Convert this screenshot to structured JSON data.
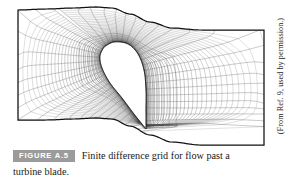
{
  "figure": {
    "badge_label": "FIGURE A.5",
    "caption_line_1": "Finite difference grid for flow past a",
    "caption_line_2": "turbine blade.",
    "credit": "(From Ref. 9, used by permission.)",
    "badge_background": "#9b9b9b",
    "badge_text_color": "#ffffff",
    "line_color": "#3a3a3a",
    "boundary_color": "#111111",
    "background": "#ffffff"
  },
  "chart_data": {
    "type": "line",
    "title": "Finite difference grid for flow past a turbine blade.",
    "xlabel": "",
    "ylabel": "",
    "grid": true,
    "legend": "none",
    "domain": {
      "left_boundary_x": 18,
      "right_boundary_x": 264,
      "top_boundary_left_y": 10,
      "top_boundary_right_y": 30,
      "bottom_boundary_left_y": 120,
      "bottom_boundary_right_y": 145,
      "xlim": [
        18,
        264
      ],
      "ylim": [
        4,
        146
      ]
    },
    "top_boundary": [
      [
        18,
        10
      ],
      [
        46,
        9
      ],
      [
        74,
        8
      ],
      [
        96,
        7
      ],
      [
        112,
        8
      ],
      [
        130,
        14
      ],
      [
        150,
        22
      ],
      [
        172,
        28
      ],
      [
        200,
        30
      ],
      [
        232,
        30
      ],
      [
        264,
        30
      ]
    ],
    "bottom_boundary": [
      [
        18,
        120
      ],
      [
        46,
        120
      ],
      [
        74,
        119
      ],
      [
        96,
        118
      ],
      [
        112,
        119
      ],
      [
        130,
        126
      ],
      [
        150,
        135
      ],
      [
        172,
        142
      ],
      [
        200,
        145
      ],
      [
        232,
        145
      ],
      [
        264,
        145
      ]
    ],
    "blade_profile": {
      "leading_edge": [
        104,
        47
      ],
      "trailing_edge": [
        146,
        129
      ],
      "chord_px": 90,
      "suction_side": [
        [
          104,
          47
        ],
        [
          114,
          42
        ],
        [
          128,
          44
        ],
        [
          138,
          54
        ],
        [
          144,
          70
        ],
        [
          146,
          90
        ],
        [
          146,
          110
        ],
        [
          146,
          129
        ]
      ],
      "pressure_side": [
        [
          104,
          47
        ],
        [
          100,
          56
        ],
        [
          102,
          68
        ],
        [
          110,
          83
        ],
        [
          122,
          98
        ],
        [
          134,
          114
        ],
        [
          146,
          129
        ]
      ]
    },
    "mesh": {
      "radial_lines": 46,
      "circumferential_lines": 34,
      "clustering": "geometric stretching normal to blade surface"
    }
  }
}
